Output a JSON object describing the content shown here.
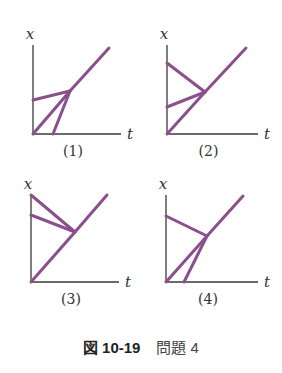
{
  "axes": {
    "y_label": "x",
    "x_label": "t"
  },
  "panels": [
    {
      "label": "(1)",
      "origin": [
        33,
        134
      ],
      "y_top": 45,
      "x_end": 121,
      "meet": [
        70,
        91
      ],
      "end": [
        109,
        48
      ],
      "starts": [
        [
          33,
          100
        ],
        [
          33,
          134
        ],
        [
          53,
          134
        ]
      ]
    },
    {
      "label": "(2)",
      "origin": [
        167,
        134
      ],
      "y_top": 45,
      "x_end": 258,
      "meet": [
        205,
        92
      ],
      "end": [
        246,
        48
      ],
      "starts": [
        [
          167,
          63
        ],
        [
          167,
          107
        ],
        [
          167,
          134
        ]
      ]
    },
    {
      "label": "(3)",
      "origin": [
        31,
        282
      ],
      "y_top": 195,
      "x_end": 119,
      "meet": [
        75,
        232
      ],
      "end": [
        107,
        195
      ],
      "starts": [
        [
          31,
          195
        ],
        [
          31,
          215
        ],
        [
          31,
          282
        ]
      ]
    },
    {
      "label": "(4)",
      "origin": [
        166,
        282
      ],
      "y_top": 195,
      "x_end": 258,
      "meet": [
        207,
        236
      ],
      "end": [
        243,
        196
      ],
      "starts": [
        [
          166,
          216
        ],
        [
          166,
          282
        ],
        [
          184,
          282
        ]
      ]
    }
  ],
  "caption": {
    "fig": "図",
    "number": "10-19",
    "title": "問題 4"
  },
  "colors": {
    "worldline": "#8a4f8c",
    "axis": "#3a3a3a"
  }
}
